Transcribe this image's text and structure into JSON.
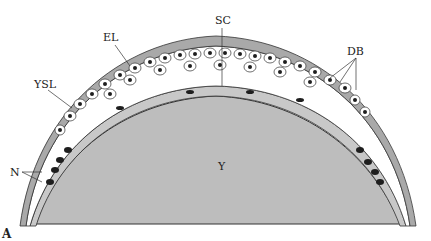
{
  "figure": {
    "panel_label": "A",
    "colors": {
      "yolk": "#bdbdbd",
      "envelope": "#a9a9a9",
      "nuclei": "#1e1e1e",
      "outline": "#333333",
      "background": "#ffffff"
    },
    "labels": {
      "sc": "SC",
      "el": "EL",
      "ysl": "YSL",
      "db": "DB",
      "n": "N",
      "y": "Y"
    }
  }
}
